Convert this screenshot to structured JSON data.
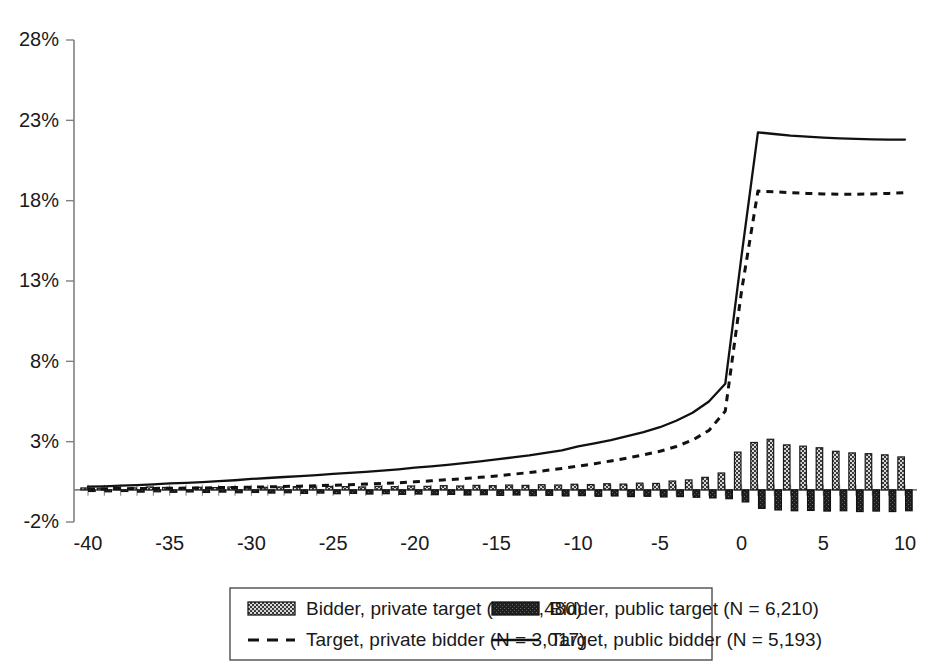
{
  "chart_data": {
    "type": "line",
    "title": "",
    "subtitle": "",
    "xlabel": "",
    "ylabel": "",
    "xlim": [
      -40,
      10
    ],
    "ylim": [
      -2,
      28
    ],
    "grid": false,
    "legend_position": "bottom",
    "ytick_labels": [
      "28%",
      "23%",
      "18%",
      "13%",
      "8%",
      "3%",
      "-2%"
    ],
    "ytick_values": [
      28,
      23,
      18,
      13,
      8,
      3,
      -2
    ],
    "xtick_labels": [
      "-40",
      "-35",
      "-30",
      "-25",
      "-20",
      "-15",
      "-10",
      "-5",
      "0",
      "5",
      "10"
    ],
    "xtick_values": [
      -40,
      -35,
      -30,
      -25,
      -20,
      -15,
      -10,
      -5,
      0,
      5,
      10
    ],
    "x": [
      -40,
      -39,
      -38,
      -37,
      -36,
      -35,
      -34,
      -33,
      -32,
      -31,
      -30,
      -29,
      -28,
      -27,
      -26,
      -25,
      -24,
      -23,
      -22,
      -21,
      -20,
      -19,
      -18,
      -17,
      -16,
      -15,
      -14,
      -13,
      -12,
      -11,
      -10,
      -9,
      -8,
      -7,
      -6,
      -5,
      -4,
      -3,
      -2,
      -1,
      0,
      1,
      2,
      3,
      4,
      5,
      6,
      7,
      8,
      9,
      10
    ],
    "series": [
      {
        "name": "Bidder, private target (N = 9,480)",
        "short_name": "bidder-private-target",
        "type": "bar",
        "style": "light-hatched",
        "n": "9,480",
        "values": [
          0.12,
          0.1,
          0.15,
          0.12,
          0.18,
          0.15,
          0.12,
          0.16,
          0.14,
          0.18,
          0.2,
          0.16,
          0.18,
          0.2,
          0.17,
          0.22,
          0.2,
          0.18,
          0.22,
          0.2,
          0.24,
          0.22,
          0.26,
          0.24,
          0.28,
          0.26,
          0.3,
          0.28,
          0.32,
          0.3,
          0.35,
          0.33,
          0.38,
          0.36,
          0.42,
          0.4,
          0.55,
          0.62,
          0.78,
          1.05,
          2.35,
          2.95,
          3.15,
          2.8,
          2.72,
          2.62,
          2.4,
          2.3,
          2.25,
          2.18,
          2.05
        ]
      },
      {
        "name": "Bidder, public target (N = 6,210)",
        "short_name": "bidder-public-target",
        "type": "bar",
        "style": "dark-solid",
        "n": "6,210",
        "values": [
          -0.1,
          -0.12,
          -0.1,
          -0.14,
          -0.12,
          -0.15,
          -0.13,
          -0.16,
          -0.14,
          -0.18,
          -0.16,
          -0.2,
          -0.18,
          -0.22,
          -0.2,
          -0.24,
          -0.22,
          -0.26,
          -0.24,
          -0.28,
          -0.26,
          -0.3,
          -0.28,
          -0.32,
          -0.3,
          -0.34,
          -0.32,
          -0.36,
          -0.34,
          -0.38,
          -0.36,
          -0.4,
          -0.38,
          -0.42,
          -0.4,
          -0.44,
          -0.42,
          -0.46,
          -0.5,
          -0.55,
          -0.75,
          -1.15,
          -1.25,
          -1.3,
          -1.28,
          -1.32,
          -1.3,
          -1.35,
          -1.32,
          -1.35,
          -1.3
        ]
      },
      {
        "name": "Target, private bidder (N = 3,017)",
        "short_name": "target-private-bidder",
        "type": "line",
        "style": "dashed",
        "n": "3,017",
        "values": [
          0.05,
          0.06,
          0.07,
          0.08,
          0.09,
          0.1,
          0.11,
          0.12,
          0.14,
          0.15,
          0.17,
          0.19,
          0.21,
          0.23,
          0.26,
          0.29,
          0.32,
          0.36,
          0.4,
          0.44,
          0.5,
          0.56,
          0.63,
          0.7,
          0.78,
          0.87,
          0.97,
          1.08,
          1.2,
          1.33,
          1.48,
          1.63,
          1.8,
          1.98,
          2.18,
          2.4,
          2.7,
          3.1,
          3.7,
          4.9,
          12.4,
          18.6,
          18.55,
          18.5,
          18.45,
          18.42,
          18.4,
          18.4,
          18.42,
          18.45,
          18.5
        ]
      },
      {
        "name": "Target, public bidder (N = 5,193)",
        "short_name": "target-public-bidder",
        "type": "line",
        "style": "solid",
        "n": "5,193",
        "values": [
          0.2,
          0.22,
          0.26,
          0.3,
          0.34,
          0.4,
          0.44,
          0.48,
          0.54,
          0.6,
          0.68,
          0.74,
          0.8,
          0.86,
          0.92,
          1.0,
          1.06,
          1.12,
          1.2,
          1.28,
          1.38,
          1.46,
          1.56,
          1.66,
          1.78,
          1.9,
          2.02,
          2.14,
          2.3,
          2.46,
          2.7,
          2.9,
          3.1,
          3.34,
          3.6,
          3.9,
          4.3,
          4.8,
          5.5,
          6.6,
          14.6,
          22.25,
          22.15,
          22.05,
          21.98,
          21.92,
          21.88,
          21.85,
          21.82,
          21.8,
          21.8
        ]
      }
    ]
  },
  "legend": {
    "entries": [
      {
        "label": "Bidder, private target (N = 9,480)",
        "swatch": "light-hatched-swatch"
      },
      {
        "label": "Bidder, public target (N = 6,210)",
        "swatch": "dark-solid-swatch"
      },
      {
        "label": "Target, private bidder (N = 3,017)",
        "swatch": "dashed-line-swatch"
      },
      {
        "label": "Target, public bidder (N = 5,193)",
        "swatch": "solid-line-swatch"
      }
    ]
  },
  "colors": {
    "line": "#111111",
    "axis": "#808080",
    "bar_dark": "#1a1a1a",
    "bar_light": "#cfcfcf",
    "background": "#ffffff"
  }
}
